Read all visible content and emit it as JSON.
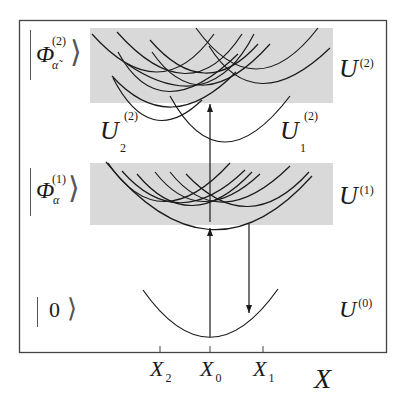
{
  "diagram": {
    "type": "potential-energy-surface-schematic",
    "axis": {
      "label": "X",
      "ticks": [
        {
          "name": "X2",
          "main": "X",
          "sub": "2",
          "x": 160
        },
        {
          "name": "X0",
          "main": "X",
          "sub": "0",
          "x": 210
        },
        {
          "name": "X1",
          "main": "X",
          "sub": "1",
          "x": 263
        }
      ]
    },
    "states": [
      {
        "id": "ground",
        "ket_text": "0",
        "surface": {
          "main": "U",
          "sup": "(0)"
        }
      },
      {
        "id": "first",
        "ket_main": "Φ",
        "ket_sup": "(1)",
        "ket_sub": "α",
        "surface": {
          "main": "U",
          "sup": "(1)"
        }
      },
      {
        "id": "second",
        "ket_main": "Φ",
        "ket_sup": "(2)",
        "ket_sub": "α̃",
        "surface": {
          "main": "U",
          "sup": "(2)"
        }
      }
    ],
    "sub_surfaces": [
      {
        "main": "U",
        "sup": "(2)",
        "sub": "2"
      },
      {
        "main": "U",
        "sup": "(2)",
        "sub": "1"
      }
    ],
    "colors": {
      "band": "#d9d9d9",
      "curve": "#1a1a1a",
      "frame": "#444444",
      "background": "#ffffff"
    },
    "arrows": [
      {
        "name": "excitation-arrow-0-to-1",
        "direction": "up",
        "x": 210
      },
      {
        "name": "excitation-arrow-1-to-2",
        "direction": "up",
        "x": 210
      },
      {
        "name": "emission-arrow-1-to-0",
        "direction": "down",
        "x": 249
      }
    ]
  }
}
